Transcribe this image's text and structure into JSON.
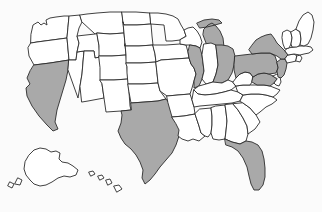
{
  "figure": {
    "type": "choropleth-map",
    "region": "United States",
    "projection": "albers-usa",
    "width": 322,
    "height": 212,
    "background_color": "#fbfbfb",
    "border_color": "#2b2b2b",
    "shaded_color": "#a9a9a9",
    "unshaded_color": "#ffffff",
    "shaded_count": 10,
    "unshaded_count": 41,
    "title": "",
    "legend": null,
    "labels_visible": false
  },
  "chart_data": {
    "type": "map",
    "title": "",
    "xlabel": "",
    "ylabel": "",
    "legend_position": "none",
    "grid": false,
    "categories": [
      "shaded",
      "unshaded"
    ],
    "values": [
      10,
      41
    ],
    "shaded_states": [
      "California",
      "Texas",
      "Illinois",
      "Michigan",
      "Ohio",
      "Pennsylvania",
      "New York",
      "New Jersey",
      "Maryland",
      "Florida"
    ],
    "unshaded_states": [
      "Washington",
      "Oregon",
      "Idaho",
      "Nevada",
      "Montana",
      "Wyoming",
      "Utah",
      "Arizona",
      "Colorado",
      "New Mexico",
      "North Dakota",
      "South Dakota",
      "Nebraska",
      "Kansas",
      "Oklahoma",
      "Minnesota",
      "Iowa",
      "Missouri",
      "Arkansas",
      "Louisiana",
      "Wisconsin",
      "Indiana",
      "Kentucky",
      "Tennessee",
      "Mississippi",
      "Alabama",
      "Georgia",
      "South Carolina",
      "North Carolina",
      "Virginia",
      "West Virginia",
      "Delaware",
      "Connecticut",
      "Rhode Island",
      "Massachusetts",
      "Vermont",
      "New Hampshire",
      "Maine",
      "Alaska",
      "Hawaii",
      "District of Columbia"
    ]
  },
  "states": [
    {
      "code": "WA",
      "name": "Washington",
      "shaded": false
    },
    {
      "code": "OR",
      "name": "Oregon",
      "shaded": false
    },
    {
      "code": "CA",
      "name": "California",
      "shaded": true
    },
    {
      "code": "NV",
      "name": "Nevada",
      "shaded": false
    },
    {
      "code": "ID",
      "name": "Idaho",
      "shaded": false
    },
    {
      "code": "MT",
      "name": "Montana",
      "shaded": false
    },
    {
      "code": "WY",
      "name": "Wyoming",
      "shaded": false
    },
    {
      "code": "UT",
      "name": "Utah",
      "shaded": false
    },
    {
      "code": "AZ",
      "name": "Arizona",
      "shaded": false
    },
    {
      "code": "CO",
      "name": "Colorado",
      "shaded": false
    },
    {
      "code": "NM",
      "name": "New Mexico",
      "shaded": false
    },
    {
      "code": "ND",
      "name": "North Dakota",
      "shaded": false
    },
    {
      "code": "SD",
      "name": "South Dakota",
      "shaded": false
    },
    {
      "code": "NE",
      "name": "Nebraska",
      "shaded": false
    },
    {
      "code": "KS",
      "name": "Kansas",
      "shaded": false
    },
    {
      "code": "OK",
      "name": "Oklahoma",
      "shaded": false
    },
    {
      "code": "TX",
      "name": "Texas",
      "shaded": true
    },
    {
      "code": "MN",
      "name": "Minnesota",
      "shaded": false
    },
    {
      "code": "IA",
      "name": "Iowa",
      "shaded": false
    },
    {
      "code": "MO",
      "name": "Missouri",
      "shaded": false
    },
    {
      "code": "AR",
      "name": "Arkansas",
      "shaded": false
    },
    {
      "code": "LA",
      "name": "Louisiana",
      "shaded": false
    },
    {
      "code": "WI",
      "name": "Wisconsin",
      "shaded": false
    },
    {
      "code": "IL",
      "name": "Illinois",
      "shaded": true
    },
    {
      "code": "MI",
      "name": "Michigan",
      "shaded": true
    },
    {
      "code": "IN",
      "name": "Indiana",
      "shaded": false
    },
    {
      "code": "OH",
      "name": "Ohio",
      "shaded": true
    },
    {
      "code": "KY",
      "name": "Kentucky",
      "shaded": false
    },
    {
      "code": "TN",
      "name": "Tennessee",
      "shaded": false
    },
    {
      "code": "MS",
      "name": "Mississippi",
      "shaded": false
    },
    {
      "code": "AL",
      "name": "Alabama",
      "shaded": false
    },
    {
      "code": "GA",
      "name": "Georgia",
      "shaded": false
    },
    {
      "code": "FL",
      "name": "Florida",
      "shaded": true
    },
    {
      "code": "SC",
      "name": "South Carolina",
      "shaded": false
    },
    {
      "code": "NC",
      "name": "North Carolina",
      "shaded": false
    },
    {
      "code": "VA",
      "name": "Virginia",
      "shaded": false
    },
    {
      "code": "WV",
      "name": "West Virginia",
      "shaded": false
    },
    {
      "code": "MD",
      "name": "Maryland",
      "shaded": true
    },
    {
      "code": "DE",
      "name": "Delaware",
      "shaded": false
    },
    {
      "code": "PA",
      "name": "Pennsylvania",
      "shaded": true
    },
    {
      "code": "NJ",
      "name": "New Jersey",
      "shaded": true
    },
    {
      "code": "NY",
      "name": "New York",
      "shaded": true
    },
    {
      "code": "CT",
      "name": "Connecticut",
      "shaded": false
    },
    {
      "code": "RI",
      "name": "Rhode Island",
      "shaded": false
    },
    {
      "code": "MA",
      "name": "Massachusetts",
      "shaded": false
    },
    {
      "code": "VT",
      "name": "Vermont",
      "shaded": false
    },
    {
      "code": "NH",
      "name": "New Hampshire",
      "shaded": false
    },
    {
      "code": "ME",
      "name": "Maine",
      "shaded": false
    },
    {
      "code": "AK",
      "name": "Alaska",
      "shaded": false
    },
    {
      "code": "HI",
      "name": "Hawaii",
      "shaded": false
    }
  ]
}
